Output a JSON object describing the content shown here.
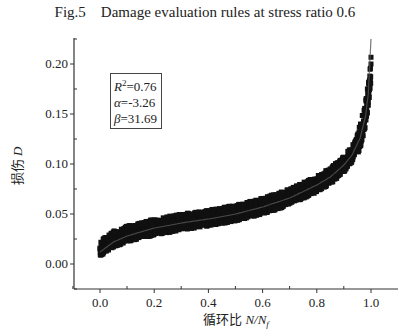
{
  "figure": {
    "title": "Fig.5    Damage evaluation rules at stress ratio 0.6"
  },
  "stats_box": {
    "r2_label": "R",
    "r2_sup": "2",
    "r2_value": "=0.76",
    "alpha_label": "α",
    "alpha_value": "=-3.26",
    "beta_label": "β",
    "beta_value": "=31.69"
  },
  "axes": {
    "ylabel_cn": "损伤",
    "ylabel_sym": "D",
    "xlabel_cn": "循环比",
    "xlabel_sym": "N/N",
    "xlabel_sub": "f",
    "yticks": [
      "0.00",
      "0.05",
      "0.10",
      "0.15",
      "0.20"
    ],
    "xticks": [
      "0.0",
      "0.2",
      "0.4",
      "0.6",
      "0.8",
      "1.0"
    ]
  },
  "colors": {
    "scatter": "#111111",
    "fit_line": "#555555",
    "axis": "#333333"
  },
  "chart_data": {
    "type": "scatter",
    "title": "Fig.5 Damage evaluation rules at stress ratio 0.6",
    "xlabel": "循环比 N/Nf",
    "ylabel": "损伤 D",
    "xlim": [
      -0.1,
      1.1
    ],
    "ylim": [
      -0.025,
      0.23
    ],
    "grid": false,
    "legend": "none",
    "annotations": [
      "R²=0.76",
      "α=-3.26",
      "β=31.69"
    ],
    "series": [
      {
        "name": "Measured damage (dense scatter band)",
        "x": [
          0.0,
          0.05,
          0.1,
          0.2,
          0.3,
          0.4,
          0.5,
          0.6,
          0.7,
          0.8,
          0.85,
          0.9,
          0.93,
          0.96,
          0.98,
          0.99,
          1.0
        ],
        "y": [
          0.015,
          0.025,
          0.03,
          0.037,
          0.042,
          0.046,
          0.051,
          0.058,
          0.067,
          0.08,
          0.088,
          0.1,
          0.11,
          0.128,
          0.15,
          0.17,
          0.195
        ]
      },
      {
        "name": "Fitted damage curve",
        "x": [
          0.0,
          0.05,
          0.1,
          0.2,
          0.3,
          0.4,
          0.5,
          0.6,
          0.7,
          0.8,
          0.85,
          0.9,
          0.93,
          0.96,
          0.98,
          0.99,
          1.0
        ],
        "y": [
          0.012,
          0.022,
          0.028,
          0.036,
          0.041,
          0.045,
          0.05,
          0.057,
          0.066,
          0.079,
          0.087,
          0.099,
          0.109,
          0.126,
          0.148,
          0.17,
          0.225
        ]
      }
    ]
  }
}
